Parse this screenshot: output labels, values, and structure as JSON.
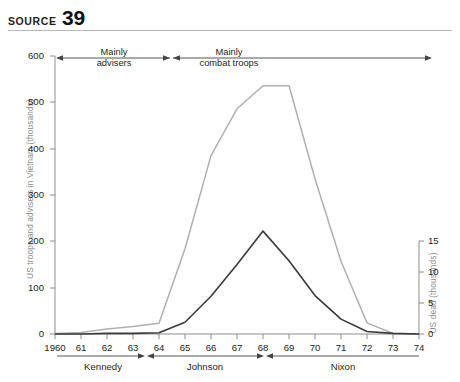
{
  "header": {
    "source_word": "SOURCE",
    "source_number": "39"
  },
  "chart_data": {
    "type": "line",
    "title": "",
    "xlabel": "",
    "grid": false,
    "legend_position": "none",
    "x": [
      1960,
      1961,
      1962,
      1963,
      1964,
      1965,
      1966,
      1967,
      1968,
      1969,
      1970,
      1971,
      1972,
      1973,
      1974
    ],
    "xtick_labels": [
      "1960",
      "61",
      "62",
      "63",
      "64",
      "65",
      "66",
      "67",
      "68",
      "69",
      "70",
      "71",
      "72",
      "73",
      "74"
    ],
    "xlim": [
      1960,
      1974
    ],
    "axes": [
      {
        "id": "left",
        "ylabel": "US troops and advisers in Vietnam (thousands)",
        "ylim": [
          0,
          600
        ],
        "yticks": [
          0,
          100,
          200,
          300,
          400,
          500,
          600
        ],
        "ytick_labels": [
          "0",
          "100",
          "200",
          "300",
          "400",
          "500",
          "600"
        ]
      },
      {
        "id": "right",
        "ylabel": "US dead (thousands)",
        "ylim": [
          0,
          15
        ],
        "yticks": [
          0,
          5,
          10,
          15
        ],
        "ytick_labels": [
          "0",
          "5",
          "10",
          "15"
        ]
      }
    ],
    "series": [
      {
        "name": "US troops and advisers in Vietnam (thousands)",
        "axis": "left",
        "color": "#b0b0b0",
        "values": [
          1,
          3,
          11,
          16,
          23,
          184,
          385,
          486,
          536,
          536,
          335,
          157,
          24,
          1,
          0
        ]
      },
      {
        "name": "US dead (thousands)",
        "axis": "right",
        "color": "#3a3a3a",
        "values": [
          0,
          0,
          0.1,
          0.1,
          0.2,
          1.9,
          6.1,
          11.2,
          16.6,
          11.8,
          6.2,
          2.4,
          0.4,
          0.1,
          0
        ]
      }
    ],
    "annotations": [
      {
        "label_line1": "Mainly",
        "label_line2": "advisers",
        "x_start": 1960,
        "x_end": 1965,
        "arrow": "both"
      },
      {
        "label_line1": "Mainly",
        "label_line2": "combat troops",
        "x_start": 1965,
        "x_end": 1974,
        "arrow": "both"
      }
    ],
    "period_bands": [
      {
        "label": "Kennedy",
        "x_start": 1960,
        "x_end": 1963.4
      },
      {
        "label": "Johnson",
        "x_start": 1963.4,
        "x_end": 1968.3
      },
      {
        "label": "Nixon",
        "x_start": 1968.3,
        "x_end": 1974
      }
    ]
  }
}
